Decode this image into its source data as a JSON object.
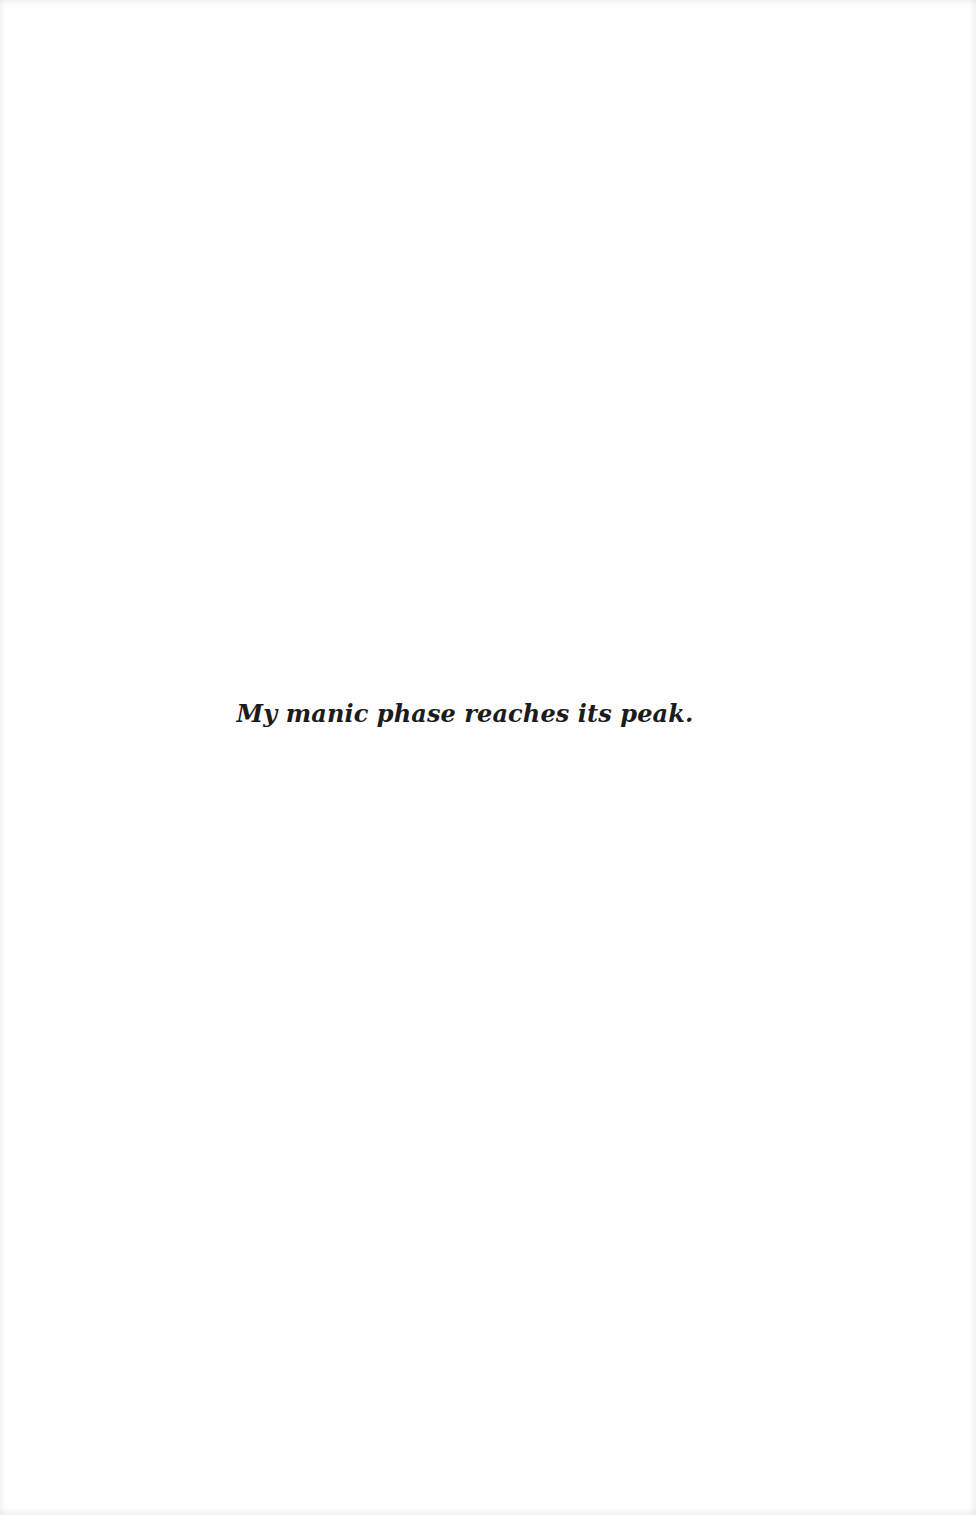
{
  "page": {
    "background_color": "#fefefe",
    "text_color": "#1c1c1c",
    "epigraph": "My manic phase reaches its peak."
  }
}
